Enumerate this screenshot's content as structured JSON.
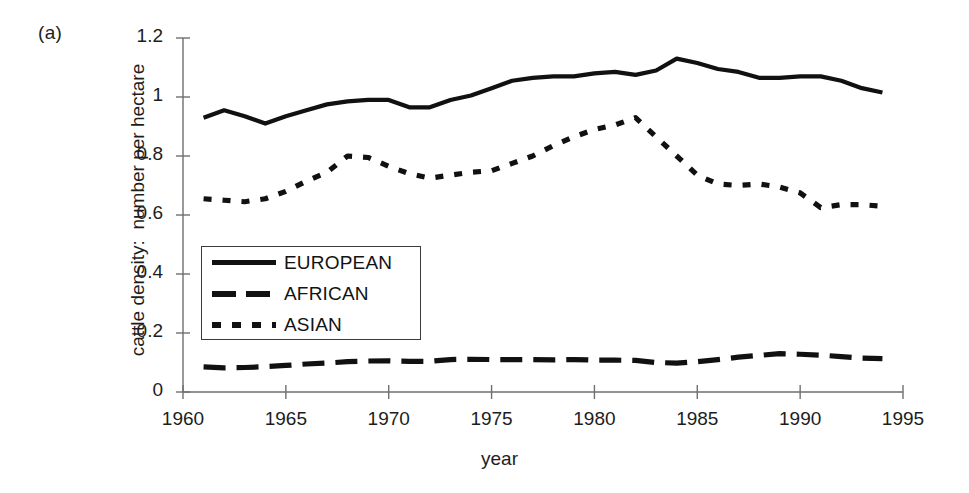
{
  "figure": {
    "panel_label": "(a)",
    "background_color": "#ffffff",
    "ink_color": "#111111"
  },
  "chart_data": {
    "type": "line",
    "title": "",
    "panel": "(a)",
    "xlabel": "year",
    "ylabel": "cattle density:  number per hectare",
    "ylabel_parts": [
      "cattle density:",
      "number per hectare"
    ],
    "xlim": [
      1960,
      1995
    ],
    "ylim": [
      0,
      1.2
    ],
    "xticks": [
      1960,
      1965,
      1970,
      1975,
      1980,
      1985,
      1990,
      1995
    ],
    "xtick_labels": [
      "1960",
      "1965",
      "1970",
      "1975",
      "1980",
      "1985",
      "1990",
      "1995"
    ],
    "yticks": [
      0,
      0.2,
      0.4,
      0.6,
      0.8,
      1,
      1.2
    ],
    "ytick_labels": [
      "0",
      "0.2",
      "0.4",
      "0.6",
      "0.8",
      "1",
      "1.2"
    ],
    "grid": false,
    "legend_position": "center-left",
    "x": [
      1961,
      1962,
      1963,
      1964,
      1965,
      1966,
      1967,
      1968,
      1969,
      1970,
      1971,
      1972,
      1973,
      1974,
      1975,
      1976,
      1977,
      1978,
      1979,
      1980,
      1981,
      1982,
      1983,
      1984,
      1985,
      1986,
      1987,
      1988,
      1989,
      1990,
      1991,
      1992,
      1993,
      1994
    ],
    "series": [
      {
        "name": "EUROPEAN",
        "line_style": "solid",
        "color": "#111111",
        "values": [
          0.93,
          0.955,
          0.935,
          0.91,
          0.935,
          0.955,
          0.975,
          0.985,
          0.99,
          0.99,
          0.965,
          0.965,
          0.99,
          1.005,
          1.03,
          1.055,
          1.065,
          1.07,
          1.07,
          1.08,
          1.085,
          1.075,
          1.09,
          1.13,
          1.115,
          1.095,
          1.085,
          1.065,
          1.065,
          1.07,
          1.07,
          1.055,
          1.03,
          1.015
        ]
      },
      {
        "name": "AFRICAN",
        "line_style": "dashed",
        "color": "#111111",
        "values": [
          0.085,
          0.082,
          0.083,
          0.086,
          0.09,
          0.095,
          0.098,
          0.103,
          0.105,
          0.106,
          0.104,
          0.104,
          0.11,
          0.111,
          0.11,
          0.11,
          0.11,
          0.109,
          0.11,
          0.108,
          0.108,
          0.107,
          0.1,
          0.098,
          0.103,
          0.11,
          0.118,
          0.124,
          0.13,
          0.128,
          0.125,
          0.12,
          0.115,
          0.113
        ]
      },
      {
        "name": "ASIAN",
        "line_style": "dotted",
        "color": "#111111",
        "values": [
          0.655,
          0.65,
          0.645,
          0.655,
          0.68,
          0.715,
          0.745,
          0.8,
          0.795,
          0.765,
          0.74,
          0.725,
          0.735,
          0.745,
          0.75,
          0.775,
          0.8,
          0.835,
          0.865,
          0.89,
          0.905,
          0.93,
          0.865,
          0.8,
          0.735,
          0.705,
          0.7,
          0.705,
          0.695,
          0.675,
          0.625,
          0.635,
          0.635,
          0.63
        ]
      }
    ]
  },
  "legend": {
    "entries": [
      {
        "label": "EUROPEAN",
        "style": "solid"
      },
      {
        "label": "AFRICAN",
        "style": "dashed"
      },
      {
        "label": "ASIAN",
        "style": "dotted"
      }
    ]
  }
}
